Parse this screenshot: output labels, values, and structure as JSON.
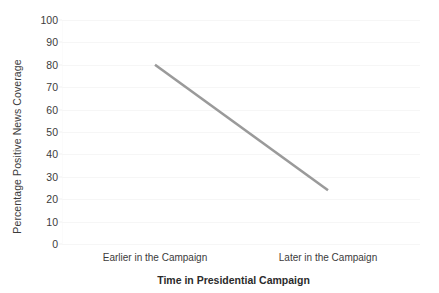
{
  "chart_data": {
    "type": "line",
    "title": "",
    "subtitle": "",
    "xlabel": "Time in Presidential Campaign",
    "ylabel": "Percentage Positive News Coverage",
    "categories": [
      "Earlier in the Campaign",
      "Later in the Campaign"
    ],
    "series": [
      {
        "name": "Positive News Coverage",
        "values": [
          80,
          24
        ],
        "color": "#9a9a9a"
      }
    ],
    "ylim": [
      0,
      100
    ],
    "ytick_step": 10,
    "ytick_labels": [
      "100",
      "90",
      "80",
      "70",
      "60",
      "50",
      "40",
      "30",
      "20",
      "10",
      "0"
    ],
    "ytick_values": [
      100,
      90,
      80,
      70,
      60,
      50,
      40,
      30,
      20,
      10,
      0
    ],
    "grid": true,
    "grid_color": "#f6f6f6",
    "legend": false,
    "legend_position": "none",
    "background_color": "#ffffff",
    "text_color": "#3b3b3b",
    "annotations": []
  }
}
